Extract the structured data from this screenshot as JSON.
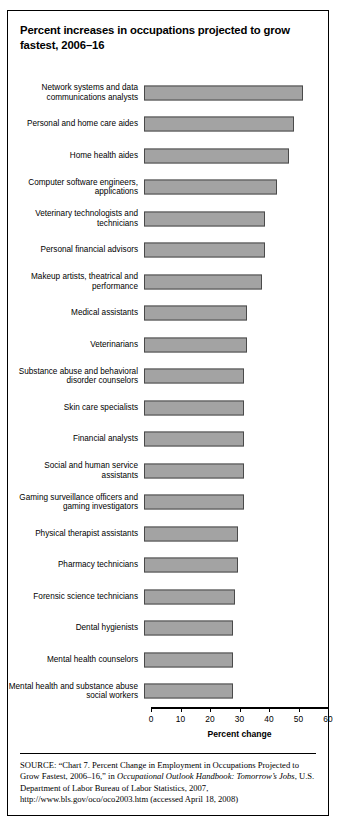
{
  "figure": {
    "title": "Percent increases in occupations projected to grow fastest, 2006–16",
    "axis_title": "Percent change",
    "bar_color": "#a3a3a3",
    "bar_border_color": "#4a4a4a"
  },
  "source": {
    "label": "SOURCE:",
    "part1": " “Chart 7. Percent Change in Employment in Occupations Projected to Grow Fastest, 2006–16,” in ",
    "italic1": "Occupational Outlook Handbook: Tomorrow’s Jobs",
    "part2": ", U.S. Department of Labor Bureau of Labor Statistics, 2007, http://www.bls.gov/oco/oco2003.htm (accessed April 18, 2008)"
  },
  "chart_data": {
    "type": "bar",
    "orientation": "horizontal",
    "title": "Percent increases in occupations projected to grow fastest, 2006–16",
    "xlabel": "Percent change",
    "ylabel": "",
    "xlim": [
      0,
      60
    ],
    "xticks": [
      0,
      10,
      20,
      30,
      40,
      50,
      60
    ],
    "grid": false,
    "legend": false,
    "categories": [
      "Network systems and data communications analysts",
      "Personal and home care aides",
      "Home health aides",
      "Computer software engineers, applications",
      "Veterinary technologists and technicians",
      "Personal financial advisors",
      "Makeup artists, theatrical and performance",
      "Medical assistants",
      "Veterinarians",
      "Substance abuse and behavioral disorder counselors",
      "Skin care specialists",
      "Financial analysts",
      "Social and human service assistants",
      "Gaming surveillance officers and gaming investigators",
      "Physical therapist assistants",
      "Pharmacy technicians",
      "Forensic science technicians",
      "Dental hygienists",
      "Mental health counselors",
      "Mental health and substance abuse social workers"
    ],
    "values": [
      54,
      51,
      49,
      45,
      41,
      41,
      40,
      35,
      35,
      34,
      34,
      34,
      34,
      34,
      32,
      32,
      31,
      30,
      30,
      30
    ]
  }
}
